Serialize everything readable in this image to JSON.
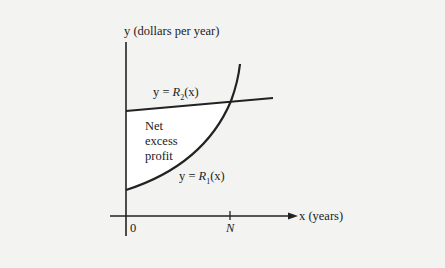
{
  "diagram": {
    "y_axis_label": "y (dollars per year)",
    "x_axis_label": "x (years)",
    "origin_label": "0",
    "n_tick_label": "N",
    "line_label_prefix": "y = ",
    "line_label_func": "R",
    "line_label_sub": "2",
    "line_label_arg": "(x)",
    "curve_label_prefix": "y = ",
    "curve_label_func": "R",
    "curve_label_sub": "1",
    "curve_label_arg": "(x)",
    "region_label": [
      "Net",
      "excess",
      "profit"
    ],
    "colors": {
      "background": "#f3f3f1",
      "region_fill": "#ffffff",
      "ink": "#222222"
    }
  }
}
